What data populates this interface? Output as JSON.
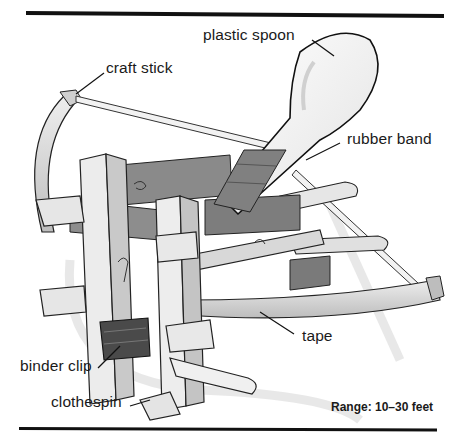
{
  "figure": {
    "labels": {
      "plastic_spoon": "plastic spoon",
      "craft_stick": "craft stick",
      "rubber_band": "rubber band",
      "tape": "tape",
      "binder_clip": "binder clip",
      "clothespin": "clothespin"
    },
    "range_note": "Range: 10–30 feet"
  },
  "colors": {
    "rule": "#111111",
    "wood_light": "#ededed",
    "wood_mid": "#cfcfcf",
    "wood_dark": "#9a9a9a",
    "tape": "#7a7a7a",
    "clip": "#4a4a4a",
    "shadow": "#d9d9d9",
    "outline": "#222222"
  }
}
